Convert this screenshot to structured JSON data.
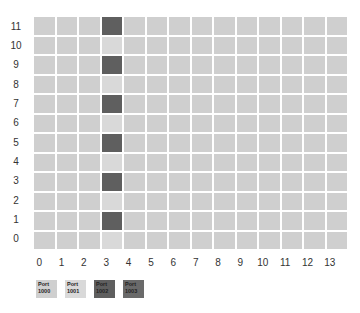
{
  "chart_data": {
    "type": "heatmap",
    "title": "",
    "xlabel": "",
    "ylabel": "",
    "x_ticks": [
      0,
      1,
      2,
      3,
      4,
      5,
      6,
      7,
      8,
      9,
      10,
      11,
      12,
      13
    ],
    "y_ticks": [
      11,
      10,
      9,
      8,
      7,
      6,
      5,
      4,
      3,
      2,
      1,
      0
    ],
    "grid": true,
    "legend_position": "bottom-left",
    "legend": [
      {
        "label": "Port 1000",
        "color": "#cfcfcf"
      },
      {
        "label": "Port 1001",
        "color": "#d9d9d9"
      },
      {
        "label": "Port 1002",
        "color": "#5f5f5f"
      },
      {
        "label": "Port 1003",
        "color": "#6a6a6a"
      }
    ],
    "cells": {
      "default": "Port 1000",
      "column_3_default": "Port 1001",
      "highlighted": [
        {
          "x": 3,
          "y": 11,
          "port": "Port 1002"
        },
        {
          "x": 3,
          "y": 9,
          "port": "Port 1002"
        },
        {
          "x": 3,
          "y": 7,
          "port": "Port 1002"
        },
        {
          "x": 3,
          "y": 5,
          "port": "Port 1002"
        },
        {
          "x": 3,
          "y": 3,
          "port": "Port 1002"
        },
        {
          "x": 3,
          "y": 1,
          "port": "Port 1002"
        }
      ]
    }
  },
  "legend_labels": [
    {
      "line1": "Port",
      "line2": "1000"
    },
    {
      "line1": "Port",
      "line2": "1001"
    },
    {
      "line1": "Port",
      "line2": "1002"
    },
    {
      "line1": "Port",
      "line2": "1003"
    }
  ]
}
